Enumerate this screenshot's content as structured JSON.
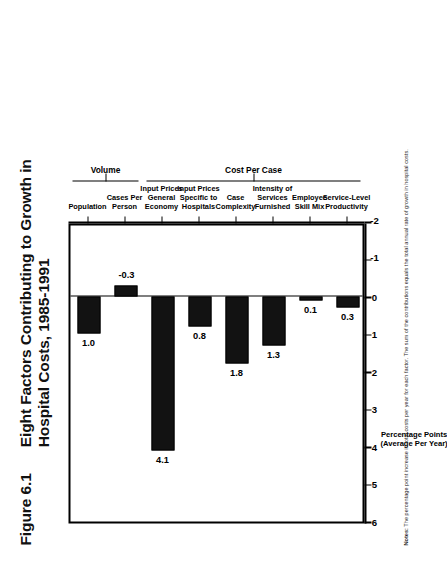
{
  "figure": {
    "number": "Figure 6.1",
    "title_line_1": "Eight Factors Contributing to Growth in",
    "title_line_2": "Hospital Costs, 1985-1991"
  },
  "axis_title": {
    "line_1": "Percentage Points",
    "line_2": "(Average Per Year)"
  },
  "groups": [
    {
      "label": "Volume",
      "from": 0,
      "to": 1
    },
    {
      "label": "Cost Per Case",
      "from": 2,
      "to": 7
    }
  ],
  "footnote": {
    "lead": "Notes:",
    "text": "The percentage point increase in total costs per year for each factor. The sum of the contributions equals the total annual rate of growth in hospital costs."
  },
  "colors": {
    "bar": "#121212",
    "axis": "#000000",
    "background": "#ffffff",
    "text": "#111111"
  },
  "chart_data": {
    "type": "bar",
    "title": "Eight Factors Contributing to Growth in Hospital Costs, 1985-1991",
    "xlabel": "",
    "ylabel": "Percentage Points (Average Per Year)",
    "ylim": [
      -2,
      6
    ],
    "yticks": [
      6,
      5,
      4,
      3,
      2,
      1,
      0,
      -1,
      -2
    ],
    "ytick_labels": [
      "6",
      "5",
      "4",
      "3",
      "2",
      "1",
      "0",
      "-1",
      "-2"
    ],
    "grid": false,
    "legend": null,
    "orientation": "vertical",
    "categories": [
      "Population",
      "Cases Per Person",
      "Input Prices General Economy",
      "Input Prices Specific to Hospitals",
      "Case Complexity",
      "Intensity of Services Furnished",
      "Employee Skill Mix",
      "Service-Level Productivity"
    ],
    "category_lines": [
      [
        "Population"
      ],
      [
        "Cases Per",
        "Person"
      ],
      [
        "Input Prices",
        "General",
        "Economy"
      ],
      [
        "Input Prices",
        "Specific to",
        "Hospitals"
      ],
      [
        "Case",
        "Complexity"
      ],
      [
        "Intensity of",
        "Services",
        "Furnished"
      ],
      [
        "Employee",
        "Skill Mix"
      ],
      [
        "Service-Level",
        "Productivity"
      ]
    ],
    "values": [
      1.0,
      -0.3,
      4.1,
      0.8,
      1.8,
      1.3,
      0.1,
      0.3
    ],
    "value_labels": [
      "1.0",
      "-0.3",
      "4.1",
      "0.8",
      "1.8",
      "1.3",
      "0.1",
      "0.3"
    ]
  }
}
